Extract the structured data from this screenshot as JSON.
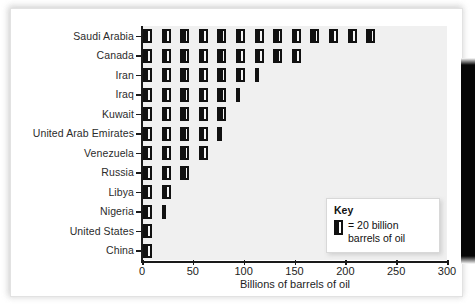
{
  "chart_data": {
    "type": "bar",
    "subtype": "pictograph",
    "title": "",
    "xlabel": "Billions of barrels of oil",
    "ylabel": "",
    "xlim": [
      0,
      300
    ],
    "xticks": [
      0,
      50,
      100,
      150,
      200,
      250,
      300
    ],
    "grid": false,
    "icon_unit": 20,
    "icon_unit_label": "= 20 billion",
    "icon_unit_label2": "barrels of oil",
    "legend_title": "Key",
    "legend_position": "inside-bottom-right",
    "categories": [
      "Saudi Arabia",
      "Canada",
      "Iran",
      "Iraq",
      "Kuwait",
      "United Arab Emirates",
      "Venezuela",
      "Russia",
      "Libya",
      "Nigeria",
      "United States",
      "China"
    ],
    "values": [
      260,
      180,
      130,
      110,
      100,
      90,
      80,
      60,
      40,
      30,
      20,
      20
    ],
    "icon_counts": [
      13,
      9,
      6.5,
      5.5,
      5,
      4.5,
      4,
      3,
      2,
      1.5,
      1,
      1
    ],
    "rows": [
      {
        "label": "Saudi Arabia",
        "value": 260,
        "icons": 13,
        "full": 13,
        "half": 0
      },
      {
        "label": "Canada",
        "value": 180,
        "icons": 9,
        "full": 9,
        "half": 0
      },
      {
        "label": "Iran",
        "value": 130,
        "icons": 6.5,
        "full": 6,
        "half": 1
      },
      {
        "label": "Iraq",
        "value": 110,
        "icons": 5.5,
        "full": 5,
        "half": 1
      },
      {
        "label": "Kuwait",
        "value": 100,
        "icons": 5,
        "full": 5,
        "half": 0
      },
      {
        "label": "United Arab Emirates",
        "value": 90,
        "icons": 4.5,
        "full": 4,
        "half": 1
      },
      {
        "label": "Venezuela",
        "value": 80,
        "icons": 4,
        "full": 4,
        "half": 0
      },
      {
        "label": "Russia",
        "value": 60,
        "icons": 3,
        "full": 3,
        "half": 0
      },
      {
        "label": "Libya",
        "value": 40,
        "icons": 2,
        "full": 2,
        "half": 0
      },
      {
        "label": "Nigeria",
        "value": 30,
        "icons": 1.5,
        "full": 1,
        "half": 1
      },
      {
        "label": "United States",
        "value": 20,
        "icons": 1,
        "full": 1,
        "half": 0
      },
      {
        "label": "China",
        "value": 20,
        "icons": 1,
        "full": 1,
        "half": 0
      }
    ]
  },
  "colors": {
    "icon": "#111111",
    "plot_background": "#f0f0f0",
    "page_background": "#ffffff",
    "axis": "#1a1a1a",
    "text": "#1d1d1d"
  },
  "key": {
    "title": "Key",
    "line1": "= 20 billion",
    "line2": "barrels of oil"
  },
  "axis": {
    "x_title": "Billions of barrels of oil",
    "x_ticks": [
      "0",
      "50",
      "100",
      "150",
      "200",
      "250",
      "300"
    ]
  }
}
